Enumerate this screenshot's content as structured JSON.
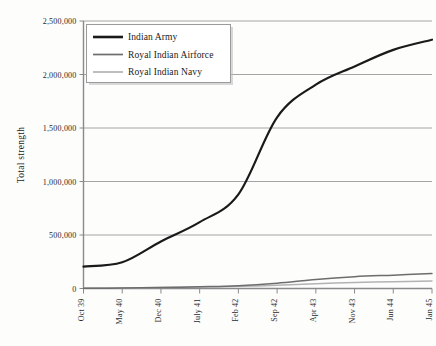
{
  "chart_data": {
    "type": "line",
    "title": "",
    "subtitle": "",
    "xlabel": "",
    "ylabel": "Total strength",
    "categories": [
      "Oct 39",
      "May 40",
      "Dec 40",
      "July 41",
      "Feb 42",
      "Sep 42",
      "Apr 43",
      "Nov 43",
      "Jun 44",
      "Jan 45"
    ],
    "xtick_labels": [
      "Oct 39",
      "May 40",
      "Dec 40",
      "July 41",
      "Feb 42",
      "Sep 42",
      "Apr 43",
      "Nov 43",
      "Jun 44",
      "Jan 45"
    ],
    "ytick_labels": [
      "0",
      "500,000",
      "1,000,000",
      "1,500,000",
      "2,000,000",
      "2,500,000"
    ],
    "ytick_values": [
      0,
      500000,
      1000000,
      1500000,
      2000000,
      2500000
    ],
    "ylim": [
      0,
      2500000
    ],
    "grid": "horizontal",
    "legend_position": "top-left",
    "series": [
      {
        "name": "Indian Army",
        "color": "#1a1a1a",
        "width": 2.2,
        "values": [
          205000,
          245000,
          440000,
          620000,
          880000,
          1600000,
          1905000,
          2075000,
          2230000,
          2325000
        ]
      },
      {
        "name": "Royal Indian Airforce",
        "color": "#6d6d6d",
        "width": 1.5,
        "values": [
          1500,
          4000,
          9000,
          16000,
          26000,
          50000,
          85000,
          110000,
          125000,
          140000
        ]
      },
      {
        "name": "Royal Indian Navy",
        "color": "#b3b3b3",
        "width": 1.5,
        "values": [
          2000,
          5000,
          9000,
          14000,
          20000,
          30000,
          45000,
          56000,
          64000,
          70000
        ]
      }
    ]
  },
  "legend": {
    "entries": [
      {
        "label": "Indian Army"
      },
      {
        "label": "Royal Indian Airforce"
      },
      {
        "label": "Royal Indian Navy"
      }
    ]
  },
  "axes": {
    "y_title": "Total strength"
  },
  "colors": {
    "background": "#fdfdfc",
    "gridline": "#9a9a9a",
    "axis": "#8a8a8a",
    "army": "#1a1a1a",
    "airforce": "#6d6d6d",
    "navy": "#b3b3b3",
    "legend_border": "#9a9a9a",
    "legend_fill": "#ffffff",
    "legend_shadow": "#b9b9b9"
  }
}
